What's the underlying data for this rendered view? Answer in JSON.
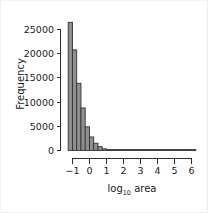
{
  "figure": {
    "background_color": "#ffffff",
    "bar_fill_color": "#8f8f8f",
    "bar_border_color": "#333333",
    "axis_color": "#2b2b2b",
    "text_color": "#1a1a1a"
  },
  "axis_titles": {
    "x_main": "log",
    "x_subscript": "10",
    "x_suffix": " area",
    "y": "Frequency"
  },
  "y_ticks": [
    {
      "label": "0",
      "value": 0
    },
    {
      "label": "5000",
      "value": 5000
    },
    {
      "label": "10000",
      "value": 10000
    },
    {
      "label": "15000",
      "value": 15000
    },
    {
      "label": "20000",
      "value": 20000
    },
    {
      "label": "25000",
      "value": 25000
    }
  ],
  "x_ticks": [
    {
      "label": "−1",
      "value": -1
    },
    {
      "label": "0",
      "value": 0
    },
    {
      "label": "1",
      "value": 1
    },
    {
      "label": "2",
      "value": 2
    },
    {
      "label": "3",
      "value": 3
    },
    {
      "label": "4",
      "value": 4
    },
    {
      "label": "5",
      "value": 5
    },
    {
      "label": "6",
      "value": 6
    }
  ],
  "chart_data": {
    "type": "bar",
    "title": "",
    "subtitle": "",
    "xlabel": "log10 area",
    "ylabel": "Frequency",
    "xlim": [
      -1.35,
      6.35
    ],
    "ylim": [
      0,
      27500
    ],
    "grid": false,
    "legend": null,
    "bin_width": 0.25,
    "bin_left_edges": [
      -1.25,
      -1.0,
      -0.75,
      -0.5,
      -0.25,
      0.0,
      0.25,
      0.5,
      0.75,
      1.0,
      1.25,
      1.5,
      1.75,
      2.0,
      2.25,
      2.5,
      2.75,
      3.0,
      3.25,
      3.5,
      3.75,
      4.0,
      4.25,
      4.5,
      4.75,
      5.0,
      5.25,
      5.5,
      5.75,
      6.0
    ],
    "categories": [
      "-1.25",
      "-1.00",
      "-0.75",
      "-0.50",
      "-0.25",
      "0.00",
      "0.25",
      "0.50",
      "0.75",
      "1.00",
      "1.25",
      "1.50",
      "1.75",
      "2.00",
      "2.25",
      "2.50",
      "2.75",
      "3.00",
      "3.25",
      "3.50",
      "3.75",
      "4.00",
      "4.25",
      "4.50",
      "4.75",
      "5.00",
      "5.25",
      "5.50",
      "5.75",
      "6.00"
    ],
    "values": [
      26500,
      20800,
      13900,
      8800,
      4900,
      2800,
      1500,
      800,
      350,
      180,
      120,
      90,
      70,
      55,
      45,
      35,
      28,
      22,
      18,
      15,
      12,
      10,
      9,
      8,
      7,
      6,
      5,
      4,
      3,
      2
    ]
  }
}
